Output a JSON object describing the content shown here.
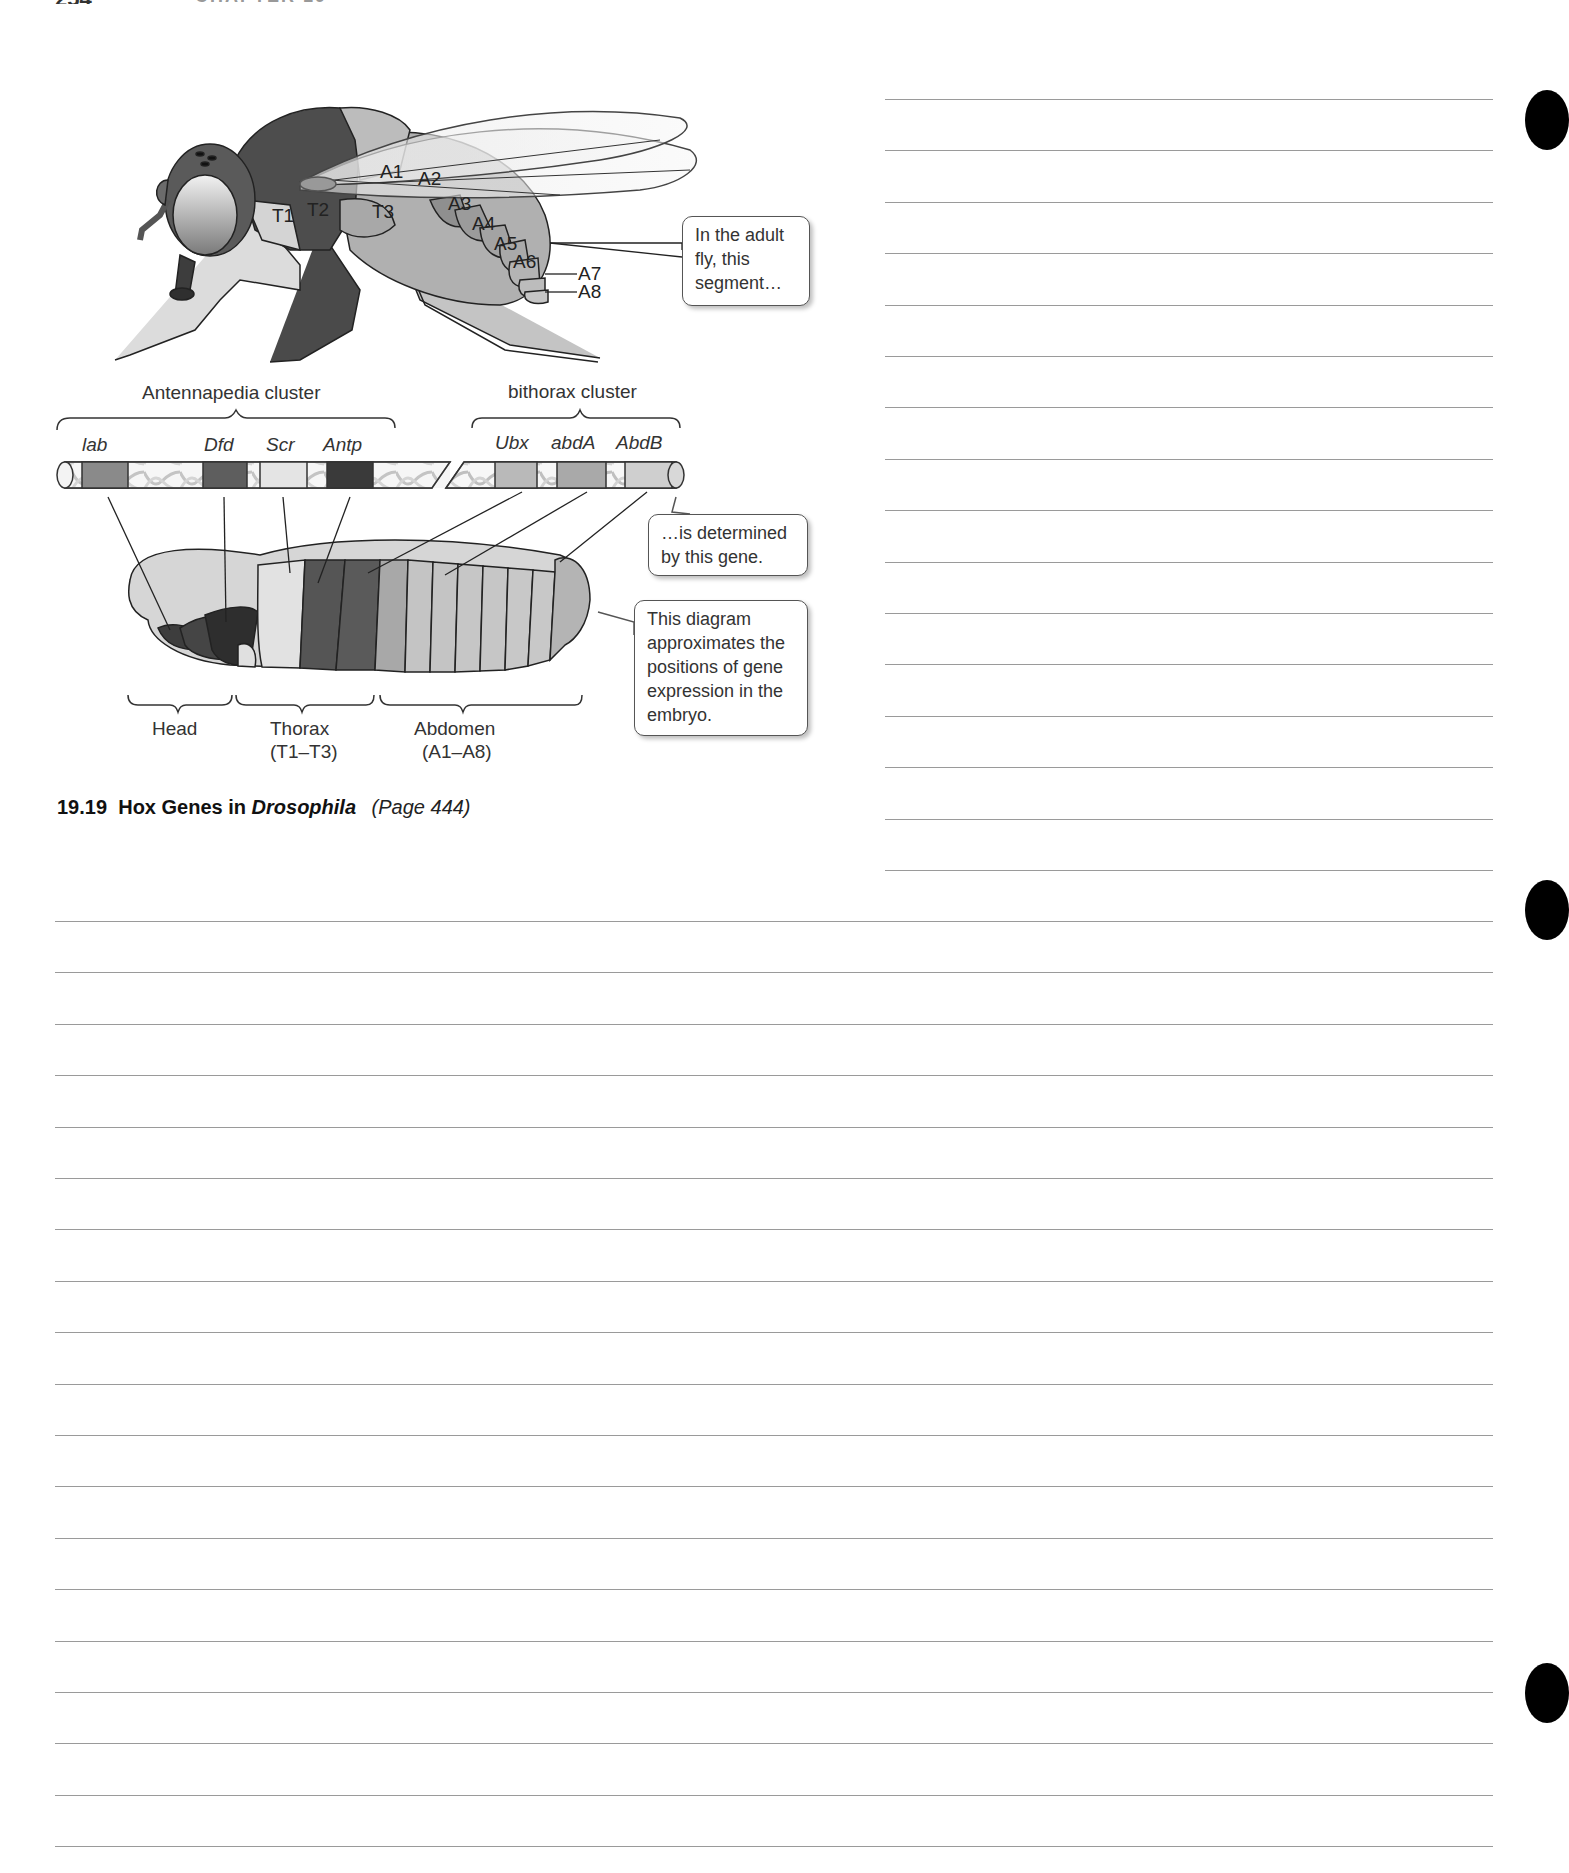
{
  "page_header": {
    "page_number": "254",
    "chapter_label": "CHAPTER 19"
  },
  "figure": {
    "number": "19.19",
    "title_prefix": "Hox Genes in",
    "title_italic": "Drosophila",
    "page_ref": "(Page 444)",
    "adult_fly": {
      "thorax_labels": [
        "T1",
        "T2",
        "T3"
      ],
      "abdomen_labels": [
        "A1",
        "A2",
        "A3",
        "A4",
        "A5",
        "A6",
        "A7",
        "A8"
      ]
    },
    "clusters": {
      "antennapedia": "Antennapedia cluster",
      "bithorax": "bithorax cluster"
    },
    "genes": [
      "lab",
      "Dfd",
      "Scr",
      "Antp",
      "Ubx",
      "abdA",
      "AbdB"
    ],
    "gene_colors": {
      "lab": "#8a8a8a",
      "Dfd": "#5e5e5e",
      "Scr": "#e4e4e4",
      "Antp": "#3a3a3a",
      "Ubx": "#b9b9b9",
      "abdA": "#a9a9a9",
      "AbdB": "#cfcfcf"
    },
    "embryo_regions": {
      "head": "Head",
      "thorax": "Thorax",
      "thorax_range": "(T1–T3)",
      "abdomen": "Abdomen",
      "abdomen_range": "(A1–A8)"
    },
    "callouts": {
      "adult_segment": [
        "In the adult",
        "fly, this",
        "segment…"
      ],
      "gene_determined": [
        "…is determined",
        "by this gene."
      ],
      "diagram_note": [
        "This diagram",
        "approximates the",
        "positions of gene",
        "expression in the",
        "embryo."
      ]
    }
  },
  "notes_area": {
    "right_column_lines": 16,
    "full_width_lines": 19
  }
}
